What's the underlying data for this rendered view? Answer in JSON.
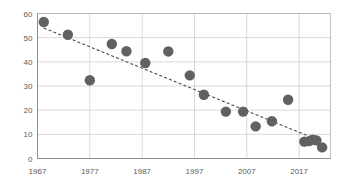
{
  "chart_data": {
    "type": "scatter",
    "title": "",
    "subtitle": "",
    "xlabel": "",
    "ylabel": "",
    "xlim": [
      1967,
      2023
    ],
    "ylim": [
      0,
      60
    ],
    "grid": true,
    "legend": null,
    "x_ticks": [
      1967,
      1977,
      1987,
      1997,
      2007,
      2017
    ],
    "x_tick_labels": [
      "1967",
      "1977",
      "1987",
      "1997",
      "2007",
      "2017"
    ],
    "y_ticks": [
      0,
      10,
      20,
      30,
      40,
      50,
      60
    ],
    "y_tick_labels": [
      "0",
      "10",
      "20",
      "30",
      "40",
      "50",
      "60"
    ],
    "marker_color": "#5f6163",
    "marker_size": 5.2,
    "points": [
      {
        "x": 1968.2,
        "y": 56.5
      },
      {
        "x": 1972.8,
        "y": 51.2
      },
      {
        "x": 1977.0,
        "y": 32.4
      },
      {
        "x": 1981.2,
        "y": 47.4
      },
      {
        "x": 1984.0,
        "y": 44.4
      },
      {
        "x": 1987.6,
        "y": 39.5
      },
      {
        "x": 1992.0,
        "y": 44.3
      },
      {
        "x": 1996.1,
        "y": 34.4
      },
      {
        "x": 1998.8,
        "y": 26.4
      },
      {
        "x": 2003.0,
        "y": 19.4
      },
      {
        "x": 2006.3,
        "y": 19.4
      },
      {
        "x": 2008.7,
        "y": 13.3
      },
      {
        "x": 2011.8,
        "y": 15.4
      },
      {
        "x": 2014.9,
        "y": 24.3
      },
      {
        "x": 2018.0,
        "y": 7.0
      },
      {
        "x": 2018.9,
        "y": 7.2
      },
      {
        "x": 2019.6,
        "y": 7.8
      },
      {
        "x": 2020.3,
        "y": 7.5
      },
      {
        "x": 2021.4,
        "y": 4.6
      }
    ],
    "trendline": {
      "type": "linear",
      "color": "#4a4a4a",
      "style": "dashed",
      "x_start": 1968.2,
      "y_start": 54.0,
      "x_end": 2020.0,
      "y_end": 8.2
    }
  }
}
